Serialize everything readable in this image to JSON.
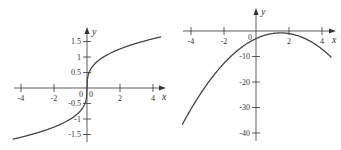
{
  "chart_data": [
    {
      "type": "line",
      "title": "",
      "xlabel": "x",
      "ylabel": "y",
      "function": "y = cbrt(x)",
      "xlim": [
        -4.5,
        4.5
      ],
      "ylim": [
        -1.65,
        1.65
      ],
      "x_ticks": [
        "-4",
        "-2",
        "0",
        "2",
        "4"
      ],
      "y_ticks": [
        "1.5",
        "1",
        "0.5",
        "0",
        "-0.5",
        "-1",
        "-1.5"
      ],
      "x": [
        -4.5,
        -3,
        -2,
        -1,
        -0.5,
        -0.1,
        0,
        0.1,
        0.5,
        1,
        2,
        3,
        4.5
      ],
      "values": [
        -1.65,
        -1.44,
        -1.26,
        -1.0,
        -0.79,
        -0.46,
        0,
        0.46,
        0.79,
        1.0,
        1.26,
        1.44,
        1.65
      ],
      "grid": false,
      "legend": "none"
    },
    {
      "type": "line",
      "title": "",
      "xlabel": "x",
      "ylabel": "y",
      "function": "y = -x^2 + 3x - 3",
      "xlim": [
        -4.5,
        4.6
      ],
      "ylim": [
        -42,
        3
      ],
      "x_ticks": [
        "-4",
        "-2",
        "0",
        "2",
        "4"
      ],
      "y_ticks": [
        "-10",
        "-20",
        "-30",
        "-40"
      ],
      "x": [
        -4.5,
        -4,
        -3,
        -2,
        -1,
        0,
        1,
        1.5,
        2,
        3,
        4,
        4.6
      ],
      "values": [
        -36.75,
        -31,
        -21,
        -13,
        -7,
        -3,
        -1,
        -0.75,
        -1,
        -3,
        -7,
        -10.4
      ],
      "grid": false,
      "legend": "none"
    }
  ],
  "left": {
    "x_axis_label": "x",
    "y_axis_label": "y",
    "origin_label_left": "0",
    "origin_label_right": "0",
    "x_tick_labels": [
      "-4",
      "-2",
      "2",
      "4"
    ],
    "y_tick_labels": [
      "1.5",
      "1",
      "0.5",
      "-0.5",
      "-1",
      "-1.5"
    ]
  },
  "right": {
    "x_axis_label": "x",
    "y_axis_label": "y",
    "origin_label": "0",
    "x_tick_labels": [
      "-4",
      "-2",
      "2",
      "4"
    ],
    "y_tick_labels": [
      "-10",
      "-20",
      "-30",
      "-40"
    ]
  }
}
